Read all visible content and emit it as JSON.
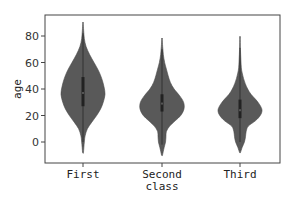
{
  "chart_data": {
    "type": "violin",
    "title": "",
    "xlabel": "class",
    "ylabel": "age",
    "categories": [
      "First",
      "Second",
      "Third"
    ],
    "yticks": [
      0,
      20,
      40,
      60,
      80
    ],
    "ylim": [
      -14,
      97
    ],
    "grid": false,
    "fill_color": "#595959",
    "series": [
      {
        "name": "First",
        "min": -8,
        "max": 90,
        "q1": 27,
        "median": 37,
        "q3": 49,
        "widest_at": 36,
        "profile": [
          [
            -8,
            0.02
          ],
          [
            0,
            0.06
          ],
          [
            5,
            0.1
          ],
          [
            10,
            0.2
          ],
          [
            15,
            0.4
          ],
          [
            20,
            0.62
          ],
          [
            25,
            0.8
          ],
          [
            30,
            0.92
          ],
          [
            36,
            1.0
          ],
          [
            42,
            0.95
          ],
          [
            48,
            0.85
          ],
          [
            54,
            0.7
          ],
          [
            60,
            0.5
          ],
          [
            66,
            0.3
          ],
          [
            72,
            0.14
          ],
          [
            78,
            0.06
          ],
          [
            84,
            0.03
          ],
          [
            90,
            0.01
          ]
        ]
      },
      {
        "name": "Second",
        "min": -10,
        "max": 78,
        "q1": 23,
        "median": 29,
        "q3": 36,
        "widest_at": 27,
        "profile": [
          [
            -10,
            0.02
          ],
          [
            -4,
            0.1
          ],
          [
            0,
            0.16
          ],
          [
            4,
            0.18
          ],
          [
            8,
            0.2
          ],
          [
            12,
            0.35
          ],
          [
            16,
            0.6
          ],
          [
            20,
            0.85
          ],
          [
            25,
            1.0
          ],
          [
            30,
            0.98
          ],
          [
            35,
            0.8
          ],
          [
            40,
            0.55
          ],
          [
            45,
            0.38
          ],
          [
            50,
            0.28
          ],
          [
            55,
            0.2
          ],
          [
            60,
            0.12
          ],
          [
            66,
            0.06
          ],
          [
            72,
            0.03
          ],
          [
            78,
            0.01
          ]
        ]
      },
      {
        "name": "Third",
        "min": -8,
        "max": 79,
        "q1": 18,
        "median": 24,
        "q3": 32,
        "widest_at": 24,
        "profile": [
          [
            -8,
            0.02
          ],
          [
            -4,
            0.1
          ],
          [
            0,
            0.2
          ],
          [
            4,
            0.25
          ],
          [
            8,
            0.28
          ],
          [
            12,
            0.38
          ],
          [
            16,
            0.7
          ],
          [
            20,
            0.92
          ],
          [
            24,
            1.0
          ],
          [
            28,
            0.9
          ],
          [
            32,
            0.72
          ],
          [
            36,
            0.5
          ],
          [
            40,
            0.35
          ],
          [
            44,
            0.24
          ],
          [
            48,
            0.16
          ],
          [
            52,
            0.1
          ],
          [
            56,
            0.06
          ],
          [
            62,
            0.04
          ],
          [
            70,
            0.02
          ],
          [
            79,
            0.01
          ]
        ]
      }
    ]
  },
  "axes": {
    "xlabel": "class",
    "ylabel": "age",
    "ytick_labels": [
      "0",
      "20",
      "40",
      "60",
      "80"
    ],
    "xtick_labels": [
      "First",
      "Second",
      "Third"
    ]
  }
}
